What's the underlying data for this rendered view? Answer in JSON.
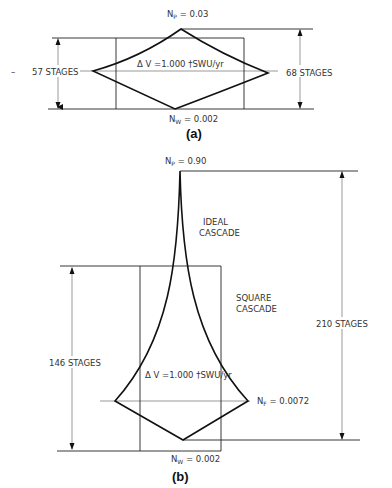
{
  "diagram_a": {
    "caption": "(a)",
    "top_label_main": "N",
    "top_label_sub": "P",
    "top_label_value": " = 0.03",
    "bottom_label_main": "N",
    "bottom_label_sub": "W",
    "bottom_label_value": " = 0.002",
    "left_stages": "57 STAGES",
    "right_stages": "68 STAGES",
    "center_label": "Δ V =1.000 †SWU/yr",
    "left_dash": "–"
  },
  "diagram_b": {
    "caption": "(b)",
    "top_label_main": "N",
    "top_label_sub": "P",
    "top_label_value": " = 0.90",
    "ideal_line1": "IDEAL",
    "ideal_line2": "CASCADE",
    "square_line1": "SQUARE",
    "square_line2": "CASCADE",
    "left_stages": "146 STAGES",
    "right_stages": "210 STAGES",
    "center_label": "Δ V =1.000 †SWU/yr",
    "feed_label_main": "N",
    "feed_label_sub": "F",
    "feed_label_value": " = 0.0072",
    "bottom_label_main": "N",
    "bottom_label_sub": "W",
    "bottom_label_value": " = 0.002"
  }
}
